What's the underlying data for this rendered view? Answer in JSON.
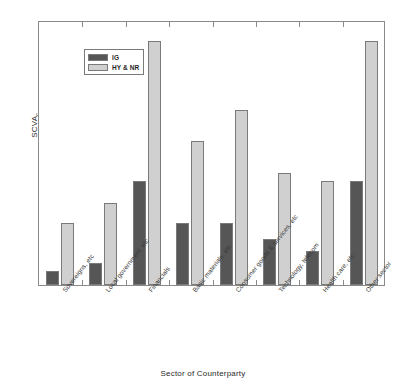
{
  "chart_data": {
    "type": "bar",
    "title": "",
    "subtitle": "",
    "xlabel": "Sector of Counterparty",
    "ylabel": "SCVA",
    "ylabel_subscript": "c",
    "grid": false,
    "legend_position": "top-left",
    "axis_ticks_visible": false,
    "ylim": [
      0,
      1.0
    ],
    "categories": [
      "Sovereigns, etc",
      "Local government, etc",
      "Financials",
      "Basic materials, etc",
      "Consumer goods & services, etc",
      "Technology, telecom",
      "Health care, etc",
      "Other sector"
    ],
    "series": [
      {
        "name": "IG",
        "color": "#565656",
        "values": [
          0.053,
          0.083,
          0.392,
          0.234,
          0.234,
          0.174,
          0.128,
          0.392
        ]
      },
      {
        "name": "HY & NR",
        "color": "#d0d0d0",
        "values": [
          0.234,
          0.309,
          0.921,
          0.543,
          0.66,
          0.423,
          0.392,
          0.921
        ]
      }
    ]
  },
  "legend": {
    "entries": [
      {
        "label": "IG",
        "swatch": "dark-gray"
      },
      {
        "label": "HY & NR",
        "swatch": "light-gray"
      }
    ]
  },
  "colors": {
    "ig_bar": "#565656",
    "hy_bar": "#d0d0d0",
    "bar_border": "#7a7a7a",
    "frame": "#8a8a8a",
    "text": "#2b2b2b",
    "background": "#ffffff"
  }
}
